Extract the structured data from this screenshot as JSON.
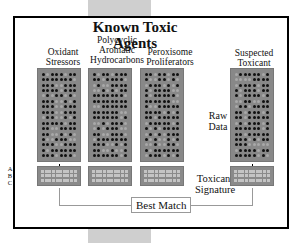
{
  "diagram": {
    "title": "Known Toxic Agents",
    "columns": [
      {
        "label": "Oxidant Stressors"
      },
      {
        "label": "Polycyclic Aromatic Hydrocarbons"
      },
      {
        "label": "Peroxisome Proliferators"
      },
      {
        "label": "Suspected Toxicant"
      }
    ],
    "raw_data_label": "Raw Data",
    "signature_label": "Toxicant Signature",
    "row_labels": [
      "A",
      "B",
      "C"
    ],
    "best_match_label": "Best Match",
    "colors": {
      "array_bg": "#888888",
      "spot_on": "#111111",
      "frame": "#000000",
      "accent_bar": "#cfcfcf"
    }
  }
}
